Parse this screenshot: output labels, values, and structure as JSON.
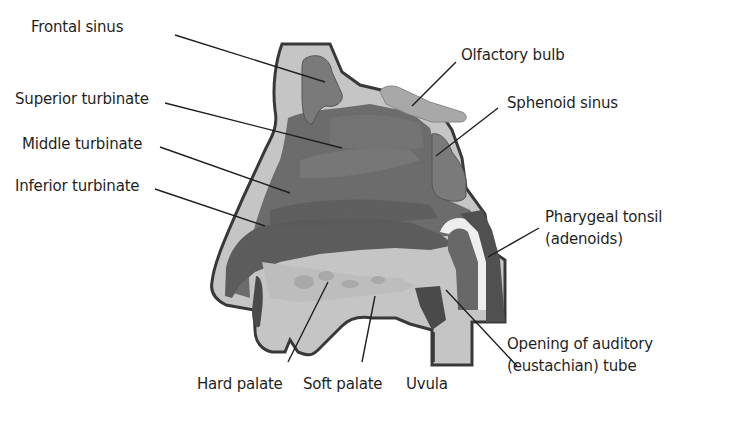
{
  "diagram": {
    "type": "anatomy-cross-section",
    "colors": {
      "background": "#ffffff",
      "bone": "#c9c9c9",
      "cavity": "#6e6e6e",
      "sinus": "#7a7a7a",
      "outline": "#3a3a3a",
      "leader_line": "#1f1f1f",
      "label_text": "#1f1f1f"
    },
    "labels": [
      {
        "id": "frontal-sinus",
        "text": "Frontal sinus"
      },
      {
        "id": "superior-turbinate",
        "text": "Superior turbinate"
      },
      {
        "id": "middle-turbinate",
        "text": "Middle turbinate"
      },
      {
        "id": "inferior-turbinate",
        "text": "Inferior turbinate"
      },
      {
        "id": "olfactory-bulb",
        "text": "Olfactory bulb"
      },
      {
        "id": "sphenoid-sinus",
        "text": "Sphenoid sinus"
      },
      {
        "id": "pharyngeal-tonsil",
        "text": "Pharygeal tonsil",
        "text2": "(adenoids)"
      },
      {
        "id": "auditory-tube",
        "text": "Opening of auditory",
        "text2": "(eustachian) tube"
      },
      {
        "id": "hard-palate",
        "text": "Hard palate"
      },
      {
        "id": "soft-palate",
        "text": "Soft palate"
      },
      {
        "id": "uvula",
        "text": "Uvula"
      }
    ]
  }
}
